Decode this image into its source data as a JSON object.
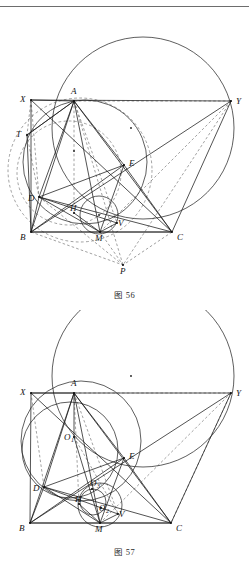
{
  "page": {
    "background": "#ffffff",
    "ink": "#1a1a1a",
    "has_top_rule": true
  },
  "figures": [
    {
      "id": "figure-56",
      "caption": "图 56",
      "type": "euclidean-geometry-construction",
      "viewbox": "0 0 249 275",
      "center_dot": {
        "x": 131,
        "y": 118,
        "label": ""
      },
      "points": [
        {
          "name": "X",
          "x": 31,
          "y": 90,
          "label": "X",
          "lx": 20,
          "ly": 92
        },
        {
          "name": "A",
          "x": 74,
          "y": 91,
          "label": "A",
          "lx": 71,
          "ly": 84
        },
        {
          "name": "Y",
          "x": 231,
          "y": 91,
          "label": "Y",
          "lx": 236,
          "ly": 94
        },
        {
          "name": "T",
          "x": 27,
          "y": 125,
          "label": "T",
          "lx": 16,
          "ly": 127
        },
        {
          "name": "E",
          "x": 124,
          "y": 155,
          "label": "E",
          "lx": 129,
          "ly": 156
        },
        {
          "name": "D",
          "x": 39,
          "y": 187,
          "label": "D",
          "lx": 28,
          "ly": 191
        },
        {
          "name": "H",
          "x": 74,
          "y": 203,
          "label": "H",
          "lx": 70,
          "ly": 201
        },
        {
          "name": "V",
          "x": 117,
          "y": 213,
          "label": "V",
          "lx": 118,
          "ly": 216
        },
        {
          "name": "B",
          "x": 31,
          "y": 222,
          "label": "B",
          "lx": 20,
          "ly": 230
        },
        {
          "name": "M",
          "x": 100,
          "y": 222,
          "label": "M",
          "lx": 95,
          "ly": 231
        },
        {
          "name": "C",
          "x": 172,
          "y": 222,
          "label": "C",
          "lx": 177,
          "ly": 230
        },
        {
          "name": "P",
          "x": 123,
          "y": 255,
          "label": "P",
          "lx": 120,
          "ly": 264
        }
      ],
      "circles": [
        {
          "name": "circumcircle",
          "cx": 143,
          "cy": 118,
          "r": 91,
          "style": "solid"
        },
        {
          "name": "incircle",
          "cx": 85,
          "cy": 152,
          "r": 62,
          "style": "solid"
        },
        {
          "name": "mixtilinear",
          "cx": 80,
          "cy": 160,
          "r": 72,
          "style": "dashed"
        },
        {
          "name": "small-circle",
          "cx": 99,
          "cy": 205,
          "r": 19,
          "style": "solid"
        },
        {
          "name": "arc-left",
          "cx": 69,
          "cy": 163,
          "r": 52,
          "style": "dashed"
        }
      ],
      "dot_marks": [
        {
          "x": 131,
          "y": 118
        },
        {
          "x": 99,
          "y": 205
        },
        {
          "x": 74,
          "y": 141
        }
      ],
      "solid_segments": [
        [
          "X",
          "Y"
        ],
        [
          "X",
          "B"
        ],
        [
          "X",
          "C"
        ],
        [
          "A",
          "B"
        ],
        [
          "A",
          "C"
        ],
        [
          "A",
          "M"
        ],
        [
          "A",
          "D"
        ],
        [
          "A",
          "E"
        ],
        [
          "B",
          "C"
        ],
        [
          "B",
          "E"
        ],
        [
          "B",
          "Y"
        ],
        [
          "C",
          "Y"
        ],
        [
          "D",
          "B"
        ],
        [
          "D",
          "C"
        ],
        [
          "D",
          "M"
        ],
        [
          "D",
          "V"
        ],
        [
          "E",
          "C"
        ],
        [
          "E",
          "M"
        ],
        [
          "T",
          "A"
        ],
        [
          "T",
          "B"
        ],
        [
          "M",
          "C"
        ],
        [
          "M",
          "V"
        ],
        [
          "A",
          "T"
        ],
        [
          "X",
          "A"
        ],
        [
          "D",
          "E"
        ],
        [
          "H",
          "M"
        ],
        [
          "B",
          "M"
        ]
      ],
      "dashed_segments": [
        [
          "A",
          "P"
        ],
        [
          "M",
          "P"
        ],
        [
          "B",
          "P"
        ],
        [
          "C",
          "P"
        ],
        [
          "A",
          "V"
        ],
        [
          "X",
          "D"
        ],
        [
          "Y",
          "M"
        ],
        [
          "Y",
          "P"
        ],
        [
          "T",
          "D"
        ],
        [
          "A",
          "H"
        ],
        [
          "X",
          "T"
        ],
        [
          "D",
          "P"
        ],
        [
          "A",
          "Y"
        ]
      ]
    },
    {
      "id": "figure-57",
      "caption": "图 57",
      "type": "euclidean-geometry-construction",
      "viewbox": "0 0 249 232",
      "center_dot": {
        "x": 131,
        "y": 66,
        "label": ""
      },
      "points": [
        {
          "name": "X",
          "x": 31,
          "y": 83,
          "label": "X",
          "lx": 20,
          "ly": 85
        },
        {
          "name": "A",
          "x": 74,
          "y": 83,
          "label": "A",
          "lx": 71,
          "ly": 76
        },
        {
          "name": "Y",
          "x": 231,
          "y": 83,
          "label": "Y",
          "lx": 236,
          "ly": 86
        },
        {
          "name": "O1",
          "x": 74,
          "y": 127,
          "label": "O",
          "sub": "1",
          "lx": 64,
          "ly": 130
        },
        {
          "name": "E",
          "x": 124,
          "y": 148,
          "label": "E",
          "lx": 129,
          "ly": 149
        },
        {
          "name": "D",
          "x": 44,
          "y": 177,
          "label": "D",
          "lx": 33,
          "ly": 181
        },
        {
          "name": "O3",
          "x": 92,
          "y": 179,
          "label": "O",
          "sub": "3",
          "lx": 90,
          "ly": 176
        },
        {
          "name": "H",
          "x": 79,
          "y": 194,
          "label": "H",
          "lx": 75,
          "ly": 192
        },
        {
          "name": "O2",
          "x": 101,
          "y": 198,
          "label": "O",
          "sub": "2",
          "lx": 99,
          "ly": 201
        },
        {
          "name": "V",
          "x": 118,
          "y": 204,
          "label": "V",
          "lx": 119,
          "ly": 207
        },
        {
          "name": "B",
          "x": 30,
          "y": 213,
          "label": "B",
          "lx": 19,
          "ly": 221
        },
        {
          "name": "M",
          "x": 100,
          "y": 213,
          "label": "M",
          "lx": 95,
          "ly": 222
        },
        {
          "name": "C",
          "x": 171,
          "y": 213,
          "label": "C",
          "lx": 176,
          "ly": 221
        }
      ],
      "circles": [
        {
          "name": "circumcircle",
          "cx": 143,
          "cy": 66,
          "r": 91,
          "style": "solid"
        },
        {
          "name": "incircle",
          "cx": 81,
          "cy": 131,
          "r": 60,
          "style": "solid"
        },
        {
          "name": "left-circle",
          "cx": 70,
          "cy": 140,
          "r": 48,
          "style": "solid"
        },
        {
          "name": "small-circle",
          "cx": 100,
          "cy": 195,
          "r": 22,
          "style": "solid"
        },
        {
          "name": "tiny-circle",
          "cx": 93,
          "cy": 192,
          "r": 13,
          "style": "solid"
        }
      ],
      "dot_marks": [
        {
          "x": 131,
          "y": 66
        }
      ],
      "solid_segments": [
        [
          "X",
          "Y"
        ],
        [
          "X",
          "B"
        ],
        [
          "X",
          "C"
        ],
        [
          "A",
          "B"
        ],
        [
          "A",
          "C"
        ],
        [
          "A",
          "M"
        ],
        [
          "A",
          "D"
        ],
        [
          "A",
          "E"
        ],
        [
          "B",
          "C"
        ],
        [
          "B",
          "E"
        ],
        [
          "B",
          "Y"
        ],
        [
          "C",
          "Y"
        ],
        [
          "D",
          "B"
        ],
        [
          "D",
          "C"
        ],
        [
          "D",
          "M"
        ],
        [
          "D",
          "V"
        ],
        [
          "E",
          "C"
        ],
        [
          "E",
          "M"
        ],
        [
          "M",
          "C"
        ],
        [
          "M",
          "V"
        ],
        [
          "X",
          "A"
        ],
        [
          "D",
          "E"
        ],
        [
          "H",
          "M"
        ],
        [
          "B",
          "M"
        ],
        [
          "A",
          "O1"
        ],
        [
          "O1",
          "M"
        ]
      ],
      "dashed_segments": [
        [
          "X",
          "D"
        ],
        [
          "Y",
          "M"
        ],
        [
          "A",
          "V"
        ],
        [
          "A",
          "H"
        ],
        [
          "Y",
          "C"
        ],
        [
          "A",
          "Y"
        ],
        [
          "O1",
          "V"
        ]
      ]
    }
  ]
}
